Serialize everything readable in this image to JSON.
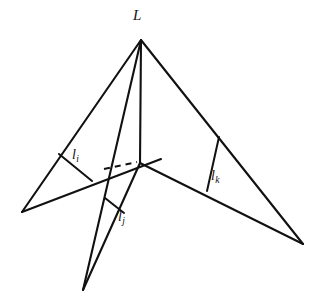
{
  "figure": {
    "title_label": "L",
    "background_color": "#ffffff",
    "stroke_color": "#111111",
    "labels": {
      "apex": {
        "base": "L",
        "sub": ""
      },
      "altitude_i": {
        "base": "l",
        "sub": "i"
      },
      "altitude_j": {
        "base": "l",
        "sub": "j"
      },
      "altitude_k": {
        "base": "l",
        "sub": "k"
      }
    },
    "geometry": {
      "description": "Three triangular faces meeting at a common apex L with a shared interior vertex; each face shows a perpendicular altitude segment.",
      "vertices": {
        "apex_L": [
          141,
          40
        ],
        "center": [
          140,
          163
        ],
        "left_outer": [
          22,
          212
        ],
        "bottom_outer": [
          83,
          290
        ],
        "right_outer": [
          303,
          244
        ],
        "left_edge_mid": [
          108,
          183
        ],
        "dashed_left_end": [
          104,
          169
        ]
      },
      "solid_edges": [
        {
          "name": "apex-to-left-outer",
          "from": [
            141,
            40
          ],
          "to": [
            22,
            212
          ]
        },
        {
          "name": "apex-to-center",
          "from": [
            141,
            40
          ],
          "to": [
            140,
            163
          ]
        },
        {
          "name": "apex-to-bottom-left-ray",
          "from": [
            141,
            40
          ],
          "to": [
            83,
            290
          ]
        },
        {
          "name": "apex-to-right-outer",
          "from": [
            141,
            40
          ],
          "to": [
            303,
            244
          ]
        },
        {
          "name": "left-outer-to-left-edge-mid",
          "from": [
            22,
            212
          ],
          "to": [
            160,
            160
          ]
        },
        {
          "name": "center-to-bottom-outer",
          "from": [
            140,
            163
          ],
          "to": [
            83,
            290
          ]
        },
        {
          "name": "center-to-right-outer",
          "from": [
            140,
            163
          ],
          "to": [
            303,
            244
          ]
        }
      ],
      "dashed_edges": [
        {
          "name": "hidden-edge",
          "from": [
            104,
            169
          ],
          "to": [
            137,
            162
          ]
        }
      ],
      "altitudes": [
        {
          "name": "altitude_i",
          "from": [
            59,
            154
          ],
          "to": [
            92,
            180
          ]
        },
        {
          "name": "altitude_j",
          "from": [
            106,
            199
          ],
          "to": [
            123,
            212
          ]
        },
        {
          "name": "altitude_k",
          "from": [
            219,
            137
          ],
          "to": [
            207,
            191
          ]
        }
      ]
    }
  }
}
